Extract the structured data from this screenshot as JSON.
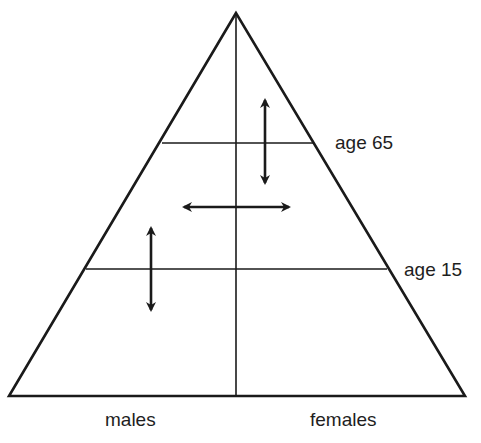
{
  "diagram": {
    "type": "population-pyramid-schematic",
    "stroke_color": "#1a1a1a",
    "background": "#ffffff",
    "shape": {
      "apex": [
        236,
        13
      ],
      "base_left": [
        9,
        396
      ],
      "base_right": [
        465,
        396
      ],
      "center_axis_x": 236
    },
    "age_lines": [
      {
        "label": "age 65",
        "y": 143,
        "x1": 162,
        "x2": 313
      },
      {
        "label": "age 15",
        "y": 269,
        "x1": 86,
        "x2": 387
      }
    ],
    "arrows": [
      {
        "name": "upper-vertical-double-arrow",
        "orientation": "vertical",
        "x": 265,
        "y1": 97,
        "y2": 186
      },
      {
        "name": "middle-horizontal-double-arrow",
        "orientation": "horizontal",
        "y": 207,
        "x1": 181,
        "x2": 292
      },
      {
        "name": "lower-vertical-double-arrow",
        "orientation": "vertical",
        "x": 151,
        "y1": 225,
        "y2": 313
      }
    ]
  },
  "labels": {
    "age_65": "age 65",
    "age_15": "age 15",
    "males": "males",
    "females": "females"
  }
}
